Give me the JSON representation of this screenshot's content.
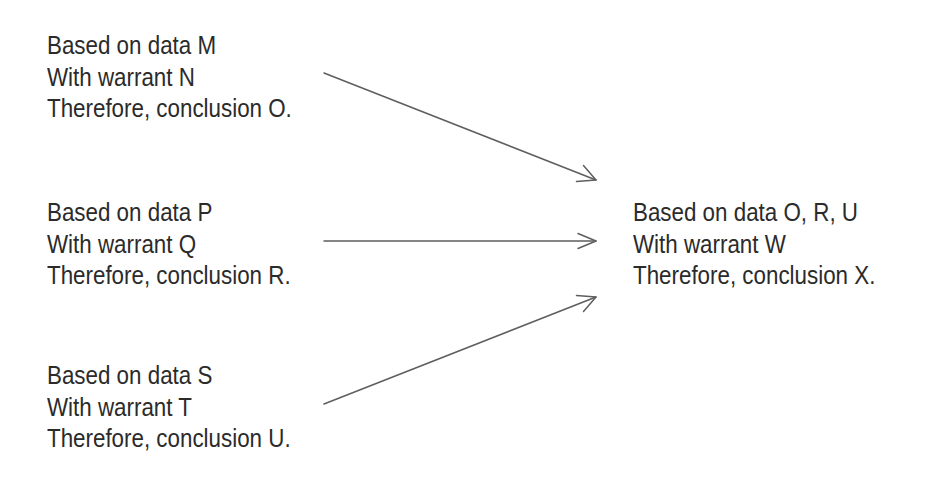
{
  "diagram": {
    "type": "argument-chain",
    "premises": [
      {
        "id": "m",
        "data_line": "Based on data M",
        "warrant_line": "With warrant N",
        "conclusion_line": "Therefore, conclusion O."
      },
      {
        "id": "p",
        "data_line": "Based on data P",
        "warrant_line": "With warrant Q",
        "conclusion_line": "Therefore, conclusion R."
      },
      {
        "id": "s",
        "data_line": "Based on data S",
        "warrant_line": "With warrant T",
        "conclusion_line": "Therefore, conclusion U."
      }
    ],
    "final": {
      "id": "x",
      "data_line": "Based on data O, R, U",
      "warrant_line": "With warrant W",
      "conclusion_line": "Therefore, conclusion X."
    },
    "arrows": [
      {
        "from": "m",
        "to": "x",
        "x1": 324,
        "y1": 73,
        "x2": 596,
        "y2": 180
      },
      {
        "from": "p",
        "to": "x",
        "x1": 324,
        "y1": 241,
        "x2": 596,
        "y2": 241
      },
      {
        "from": "s",
        "to": "x",
        "x1": 324,
        "y1": 404,
        "x2": 596,
        "y2": 297
      }
    ],
    "colors": {
      "text": "#2b2b2b",
      "arrow": "#5e5e5e",
      "background": "#ffffff"
    }
  }
}
